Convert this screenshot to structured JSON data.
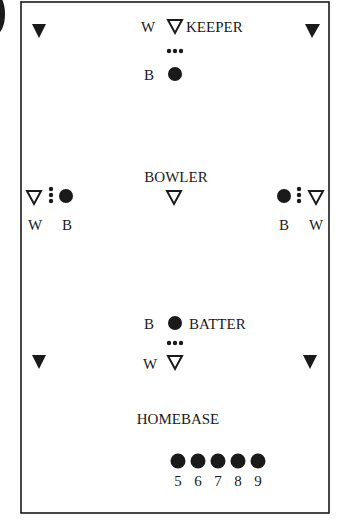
{
  "diagram": {
    "type": "field-layout",
    "colors": {
      "ink": "#1a1a1a",
      "background": "#ffffff"
    },
    "positions": {
      "keeper": {
        "label": "KEEPER",
        "role_labels": {
          "wicket": "W",
          "batter": "B"
        }
      },
      "bowler": {
        "label": "BOWLER"
      },
      "left_side": {
        "wicket": "W",
        "batter": "B"
      },
      "right_side": {
        "batter": "B",
        "wicket": "W"
      },
      "batter": {
        "label": "BATTER",
        "role_labels": {
          "batter": "B",
          "wicket": "W"
        }
      },
      "homebase": {
        "label": "HOMEBASE"
      }
    },
    "waiting_batters": [
      "5",
      "6",
      "7",
      "8",
      "9"
    ],
    "legend_icons": {
      "filled_triangle": "corner-base-icon",
      "hollow_triangle": "wicket-icon",
      "filled_circle": "batter-icon",
      "dot_stack": "ball-stack-icon"
    }
  }
}
